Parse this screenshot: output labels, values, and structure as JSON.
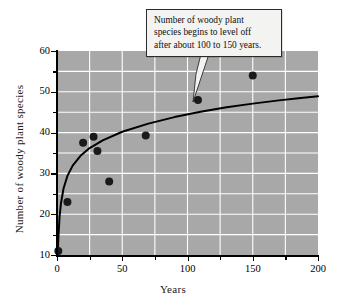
{
  "chart_data": {
    "type": "scatter",
    "title": "",
    "xlabel": "Years",
    "ylabel": "Number of woody plant species",
    "xlim": [
      0,
      200
    ],
    "ylim": [
      10,
      60
    ],
    "x_ticks": [
      0,
      50,
      100,
      150,
      200
    ],
    "x_tick_labels": [
      "0",
      "50",
      "100",
      "150",
      "200"
    ],
    "x_minor_ticks": [
      25,
      75,
      125,
      175
    ],
    "y_ticks": [
      10,
      20,
      30,
      40,
      50,
      60
    ],
    "y_tick_labels": [
      "10",
      "20",
      "30",
      "40",
      "50",
      "60"
    ],
    "y_minor_ticks": [
      15,
      25,
      35,
      45,
      55
    ],
    "grid": true,
    "grid_x": [
      25,
      50,
      75,
      100,
      125,
      150,
      175
    ],
    "grid_y": [
      15,
      20,
      25,
      30,
      35,
      40,
      45,
      50,
      55
    ],
    "plot_background": "#a8a8a8",
    "grid_color": "#ffffff",
    "marker_color": "#1a1a1a",
    "curve_color": "#000000",
    "legend": null,
    "points": [
      {
        "x": 1,
        "y": 11
      },
      {
        "x": 8,
        "y": 23
      },
      {
        "x": 20,
        "y": 37.5
      },
      {
        "x": 28,
        "y": 39
      },
      {
        "x": 31,
        "y": 35.5
      },
      {
        "x": 40,
        "y": 28
      },
      {
        "x": 68,
        "y": 39.3
      },
      {
        "x": 108,
        "y": 48
      },
      {
        "x": 150,
        "y": 54
      }
    ],
    "series": [
      {
        "name": "fitted logarithmic trend",
        "type": "line",
        "points": [
          {
            "x": 0.6,
            "y": 10.2
          },
          {
            "x": 1,
            "y": 14.0
          },
          {
            "x": 2,
            "y": 19.5
          },
          {
            "x": 3,
            "y": 22.6
          },
          {
            "x": 5,
            "y": 26.3
          },
          {
            "x": 8,
            "y": 29.4
          },
          {
            "x": 12,
            "y": 31.9
          },
          {
            "x": 18,
            "y": 34.3
          },
          {
            "x": 25,
            "y": 36.2
          },
          {
            "x": 35,
            "y": 38.1
          },
          {
            "x": 50,
            "y": 40.2
          },
          {
            "x": 70,
            "y": 42.2
          },
          {
            "x": 90,
            "y": 43.8
          },
          {
            "x": 110,
            "y": 45.1
          },
          {
            "x": 130,
            "y": 46.2
          },
          {
            "x": 150,
            "y": 47.1
          },
          {
            "x": 170,
            "y": 47.9
          },
          {
            "x": 185,
            "y": 48.4
          },
          {
            "x": 200,
            "y": 48.9
          }
        ]
      }
    ],
    "annotations": [
      {
        "name": "level-off-callout",
        "text": "Number of woody plant species begins to level off after about 100 to 150 years.",
        "lines": [
          "Number of woody plant",
          "species begins to level off",
          "after about 100 to 150 years."
        ],
        "points_to": {
          "x": 108,
          "y": 48
        }
      }
    ]
  },
  "callout": {
    "line1": "Number of woody plant",
    "line2": "species begins to level off",
    "line3": "after about 100 to 150 years."
  },
  "axes": {
    "x_title": "Years",
    "y_title": "Number of woody plant species"
  }
}
